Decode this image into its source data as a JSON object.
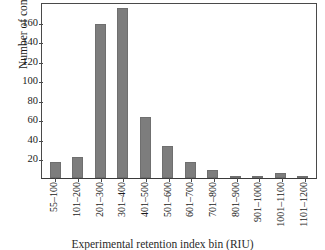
{
  "chart_data": {
    "type": "bar",
    "title": "",
    "xlabel": "Experimental retention index bin (RIU)",
    "ylabel": "Number of compounds",
    "categories": [
      "55–100",
      "101–200",
      "201–300",
      "301–400",
      "401–500",
      "501–600",
      "601–700",
      "701–800",
      "801–900",
      "901–1000",
      "1001–1100",
      "1101–1200"
    ],
    "values": [
      16,
      22,
      158,
      174,
      62,
      33,
      16,
      8,
      2,
      2,
      5,
      1
    ],
    "ylim": [
      0,
      180
    ],
    "yticks": [
      20,
      40,
      60,
      80,
      100,
      120,
      140,
      160
    ],
    "ytick_labels": [
      "20",
      "40",
      "60",
      "80",
      "100",
      "120",
      "140",
      "160"
    ],
    "grid": false,
    "legend": false,
    "bar_color": "#7d7d7d",
    "axis_color": "#4a4a4a",
    "background": "#ffffff"
  }
}
